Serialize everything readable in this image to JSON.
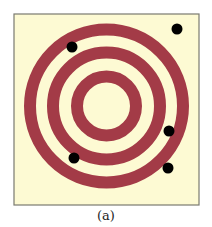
{
  "figure": {
    "caption": "(a)",
    "colors": {
      "background": "#FDFAD3",
      "ring": "#A33B47",
      "border": "#7A7A70",
      "dot": "#000000"
    },
    "frame": {
      "x": 14,
      "y": 14,
      "width": 185,
      "height": 191
    },
    "target": {
      "center": [
        106.5,
        106
      ],
      "rings": [
        {
          "name": "outer",
          "radius": 76.5,
          "width": 12
        },
        {
          "name": "middle",
          "radius": 53.5,
          "width": 12
        },
        {
          "name": "inner",
          "radius": 29.5,
          "width": 12
        }
      ]
    },
    "dots": [
      {
        "x": 177,
        "y": 29,
        "r": 5.5
      },
      {
        "x": 72,
        "y": 47,
        "r": 5.5
      },
      {
        "x": 169,
        "y": 131,
        "r": 5.5
      },
      {
        "x": 74,
        "y": 158,
        "r": 5.5
      },
      {
        "x": 168,
        "y": 168,
        "r": 5.5
      }
    ]
  }
}
